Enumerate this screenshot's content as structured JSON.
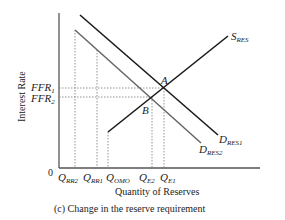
{
  "diagram": {
    "caption": "(c) Change in the reserve requirement",
    "x_axis_label": "Quantity of Reserves",
    "y_axis_label": "Interest Rate",
    "origin_label": "0",
    "y_ticks": [
      {
        "main": "FFR",
        "sub": "1"
      },
      {
        "main": "FFR",
        "sub": "2"
      }
    ],
    "x_ticks": [
      {
        "main": "Q",
        "sub": "RR2"
      },
      {
        "main": "Q",
        "sub": "RR1"
      },
      {
        "main": "Q",
        "sub": "OMO"
      },
      {
        "main": "Q",
        "sub": "E2"
      },
      {
        "main": "Q",
        "sub": "E1"
      }
    ],
    "curves": {
      "supply": {
        "main": "S",
        "sub": "RES"
      },
      "demand1": {
        "main": "D",
        "sub": "RES1"
      },
      "demand2": {
        "main": "D",
        "sub": "RES2"
      }
    },
    "points": {
      "a": "A",
      "b": "B"
    },
    "colors": {
      "demand1": "#1a1a1a",
      "demand2": "#666666",
      "supply": "#1a1a1a",
      "axis": "#555555",
      "guide": "#777777"
    }
  }
}
